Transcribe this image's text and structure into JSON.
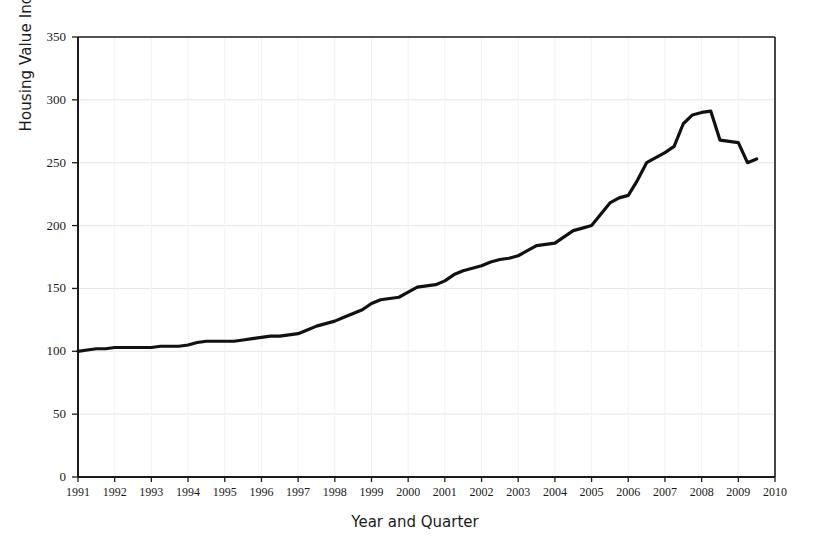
{
  "chart_data": {
    "type": "line",
    "title": "",
    "xlabel": "Year and Quarter",
    "ylabel": "Housing Value Index",
    "xlim": [
      1991,
      2010
    ],
    "ylim": [
      0,
      350
    ],
    "grid": true,
    "legend": null,
    "x_tick_labels": [
      "1991",
      "1992",
      "1993",
      "1994",
      "1995",
      "1996",
      "1997",
      "1998",
      "1999",
      "2000",
      "2001",
      "2002",
      "2003",
      "2004",
      "2005",
      "2006",
      "2007",
      "2008",
      "2009",
      "2010"
    ],
    "y_tick_labels": [
      "0",
      "50",
      "100",
      "150",
      "200",
      "250",
      "300",
      "350"
    ],
    "y_ticks": [
      0,
      50,
      100,
      150,
      200,
      250,
      300,
      350
    ],
    "series": [
      {
        "name": "Housing Value Index",
        "x": [
          1991.0,
          1991.25,
          1991.5,
          1991.75,
          1992.0,
          1992.25,
          1992.5,
          1992.75,
          1993.0,
          1993.25,
          1993.5,
          1993.75,
          1994.0,
          1994.25,
          1994.5,
          1994.75,
          1995.0,
          1995.25,
          1995.5,
          1995.75,
          1996.0,
          1996.25,
          1996.5,
          1996.75,
          1997.0,
          1997.25,
          1997.5,
          1997.75,
          1998.0,
          1998.25,
          1998.5,
          1998.75,
          1999.0,
          1999.25,
          1999.5,
          1999.75,
          2000.0,
          2000.25,
          2000.5,
          2000.75,
          2001.0,
          2001.25,
          2001.5,
          2001.75,
          2002.0,
          2002.25,
          2002.5,
          2002.75,
          2003.0,
          2003.25,
          2003.5,
          2003.75,
          2004.0,
          2004.25,
          2004.5,
          2004.75,
          2005.0,
          2005.25,
          2005.5,
          2005.75,
          2006.0,
          2006.25,
          2006.5,
          2006.75,
          2007.0,
          2007.25,
          2007.5,
          2007.75,
          2008.0,
          2008.25,
          2008.5,
          2008.75,
          2009.0,
          2009.25,
          2009.5
        ],
        "values": [
          100,
          101,
          102,
          102,
          103,
          103,
          103,
          103,
          103,
          104,
          104,
          104,
          105,
          107,
          108,
          108,
          108,
          108,
          109,
          110,
          111,
          112,
          112,
          113,
          114,
          117,
          120,
          122,
          124,
          127,
          130,
          133,
          138,
          141,
          142,
          143,
          147,
          151,
          152,
          153,
          156,
          161,
          164,
          166,
          168,
          171,
          173,
          174,
          176,
          180,
          184,
          185,
          186,
          191,
          196,
          198,
          200,
          209,
          218,
          222,
          224,
          236,
          250,
          254,
          258,
          263,
          281,
          288,
          290,
          293,
          300,
          292,
          288,
          289,
          282
        ]
      }
    ],
    "annotations": [
      {
        "label": "peak",
        "x": 2007.5,
        "y": 300
      },
      {
        "label": "start",
        "x": 1991.0,
        "y": 100
      },
      {
        "label": "end",
        "x": 2009.5,
        "y": 253
      }
    ],
    "extra_points": {
      "tail_x": [
        2008.0,
        2008.25,
        2008.5,
        2008.75,
        2009.0,
        2009.25,
        2009.5
      ],
      "tail_y": [
        290,
        291,
        268,
        267,
        266,
        250,
        253
      ]
    }
  },
  "axes": {
    "frame_color": "#1a1a1a",
    "grid_color": "#e6e6e6",
    "line_color": "#111111",
    "line_width": 3.2
  }
}
